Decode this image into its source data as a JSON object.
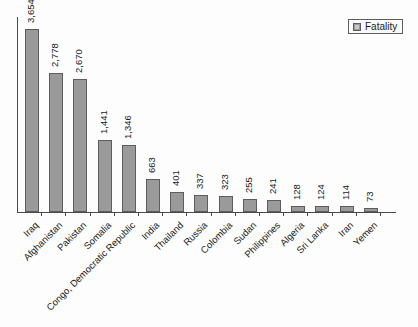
{
  "chart_data": {
    "type": "bar",
    "title": "",
    "xlabel": "",
    "ylabel": "",
    "ylim": [
      0,
      4000
    ],
    "grid": false,
    "legend_position": "top-right",
    "categories": [
      "Iraq",
      "Afghanistan",
      "Pakistan",
      "Somalia",
      "Congo, Democratic Republic",
      "India",
      "Thailand",
      "Russia",
      "Colombia",
      "Sudan",
      "Philippines",
      "Algeria",
      "Sri Lanka",
      "Iran",
      "Yemen"
    ],
    "series": [
      {
        "name": "Fatality",
        "color": "#9a9a9a",
        "values": [
          3654,
          2778,
          2670,
          1441,
          1346,
          663,
          401,
          337,
          323,
          255,
          241,
          128,
          124,
          114,
          73
        ],
        "value_labels": [
          "3,654",
          "2,778",
          "2,670",
          "1,441",
          "1,346",
          "663",
          "401",
          "337",
          "323",
          "255",
          "241",
          "128",
          "124",
          "114",
          "73"
        ]
      }
    ]
  },
  "legend": {
    "entries": [
      {
        "label": "Fatality",
        "swatch_name": "legend-swatch-fatality"
      }
    ]
  },
  "colors": {
    "bar_fill": "#9a9a9a",
    "bar_border": "#5d5d5d",
    "axis": "#4a4a4a",
    "text": "#1a1a1a",
    "background": "#fdfdfd"
  }
}
